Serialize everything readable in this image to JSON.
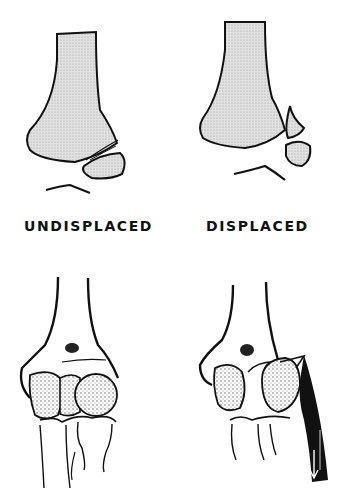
{
  "figure": {
    "panels": [
      {
        "id": "top-left",
        "view": "lateral x-ray outline",
        "state": "undisplaced"
      },
      {
        "id": "top-right",
        "view": "lateral x-ray outline",
        "state": "displaced"
      },
      {
        "id": "bottom-left",
        "view": "anterior elbow drawing",
        "state": "undisplaced"
      },
      {
        "id": "bottom-right",
        "view": "anterior elbow drawing with muscle pull arrow",
        "state": "displaced"
      }
    ],
    "labels": {
      "undisplaced": "UNDISPLACED",
      "displaced": "DISPLACED"
    },
    "colors": {
      "ink": "#111111",
      "bone_fill": "#d9d9d9",
      "background": "#ffffff"
    }
  }
}
